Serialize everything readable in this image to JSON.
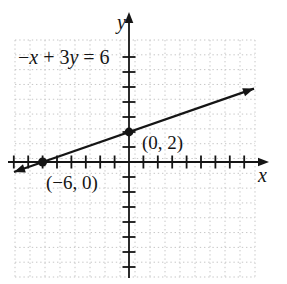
{
  "figure": {
    "background": "#ffffff",
    "ink_color": "#151515",
    "grid_color": "#c6c6c6"
  },
  "chart_data": {
    "type": "line",
    "equation": "−x + 3y = 6",
    "xlabel": "x",
    "ylabel": "y",
    "x_tick_range": [
      -8,
      8
    ],
    "y_tick_range": [
      -7,
      7
    ],
    "tick_step": 1,
    "grid": "dotted",
    "legend": "none",
    "series": [
      {
        "name": "−x + 3y = 6",
        "points_marked": [
          {
            "x": -6,
            "y": 0,
            "label": "(−6, 0)"
          },
          {
            "x": 0,
            "y": 2,
            "label": "(0, 2)"
          }
        ]
      }
    ]
  }
}
